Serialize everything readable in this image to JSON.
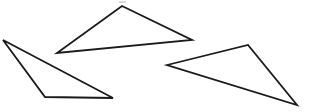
{
  "image": {
    "width": 313,
    "height": 112,
    "background_color": "#ffffff",
    "description": "Three outlined triangles on a plain white background"
  },
  "style": {
    "stroke_color": "#1a1a1a",
    "stroke_width": 1.8,
    "fill": "none",
    "noise_color": "#bdbdbd"
  },
  "chart_data": {
    "type": "scatter",
    "title": "",
    "subtitle": "",
    "xlabel": "",
    "ylabel": "",
    "grid": false,
    "legend": "none",
    "xlim": [
      0,
      313
    ],
    "ylim": [
      0,
      112
    ],
    "shapes": [
      {
        "name": "top-triangle",
        "type": "triangle",
        "points": "122,6 192,40 57,53",
        "vertices": [
          [
            122,
            6
          ],
          [
            192,
            40
          ],
          [
            57,
            53
          ]
        ],
        "orientation": "apex-up"
      },
      {
        "name": "left-triangle",
        "type": "triangle",
        "points": "3,40 113,98 45,97",
        "vertices": [
          [
            3,
            40
          ],
          [
            113,
            98
          ],
          [
            45,
            97
          ]
        ],
        "orientation": "apex-left"
      },
      {
        "name": "right-triangle",
        "type": "triangle",
        "points": "167,65 248,45 297,105",
        "vertices": [
          [
            167,
            65
          ],
          [
            248,
            45
          ],
          [
            297,
            105
          ]
        ],
        "orientation": "apex-right"
      }
    ],
    "artifacts": [
      {
        "name": "scan-speck-top",
        "x": 119,
        "y": 1,
        "width": 7,
        "height": 2
      }
    ]
  }
}
